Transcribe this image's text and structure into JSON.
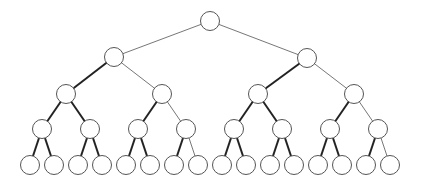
{
  "diagram": {
    "type": "binary-tree",
    "depth": 4,
    "node_radius": 9.5,
    "colors": {
      "node_stroke": "#555555",
      "thin_edge": "#777777",
      "thick_edge": "#222222",
      "background": "#ffffff"
    },
    "nodes": [
      {
        "id": 0,
        "x": 210,
        "y": 21
      },
      {
        "id": 1,
        "x": 114,
        "y": 57
      },
      {
        "id": 2,
        "x": 307,
        "y": 58
      },
      {
        "id": 3,
        "x": 66,
        "y": 94
      },
      {
        "id": 4,
        "x": 162,
        "y": 94
      },
      {
        "id": 5,
        "x": 258,
        "y": 94
      },
      {
        "id": 6,
        "x": 354,
        "y": 94
      },
      {
        "id": 7,
        "x": 42,
        "y": 129
      },
      {
        "id": 8,
        "x": 90,
        "y": 129
      },
      {
        "id": 9,
        "x": 138,
        "y": 129
      },
      {
        "id": 10,
        "x": 186,
        "y": 129
      },
      {
        "id": 11,
        "x": 234,
        "y": 129
      },
      {
        "id": 12,
        "x": 282,
        "y": 129
      },
      {
        "id": 13,
        "x": 330,
        "y": 129
      },
      {
        "id": 14,
        "x": 378,
        "y": 129
      },
      {
        "id": 15,
        "x": 30,
        "y": 165
      },
      {
        "id": 16,
        "x": 54,
        "y": 165
      },
      {
        "id": 17,
        "x": 78,
        "y": 165
      },
      {
        "id": 18,
        "x": 102,
        "y": 165
      },
      {
        "id": 19,
        "x": 126,
        "y": 165
      },
      {
        "id": 20,
        "x": 150,
        "y": 165
      },
      {
        "id": 21,
        "x": 174,
        "y": 165
      },
      {
        "id": 22,
        "x": 198,
        "y": 165
      },
      {
        "id": 23,
        "x": 222,
        "y": 165
      },
      {
        "id": 24,
        "x": 246,
        "y": 165
      },
      {
        "id": 25,
        "x": 270,
        "y": 165
      },
      {
        "id": 26,
        "x": 294,
        "y": 165
      },
      {
        "id": 27,
        "x": 318,
        "y": 165
      },
      {
        "id": 28,
        "x": 342,
        "y": 165
      },
      {
        "id": 29,
        "x": 366,
        "y": 165
      },
      {
        "id": 30,
        "x": 390,
        "y": 165
      }
    ],
    "edges": [
      {
        "from": 0,
        "to": 1,
        "style": "thin"
      },
      {
        "from": 0,
        "to": 2,
        "style": "thin"
      },
      {
        "from": 1,
        "to": 3,
        "style": "thick"
      },
      {
        "from": 1,
        "to": 4,
        "style": "thin"
      },
      {
        "from": 2,
        "to": 5,
        "style": "thick"
      },
      {
        "from": 2,
        "to": 6,
        "style": "thin"
      },
      {
        "from": 3,
        "to": 7,
        "style": "thick"
      },
      {
        "from": 3,
        "to": 8,
        "style": "thick"
      },
      {
        "from": 4,
        "to": 9,
        "style": "thick"
      },
      {
        "from": 4,
        "to": 10,
        "style": "thin"
      },
      {
        "from": 5,
        "to": 11,
        "style": "thick"
      },
      {
        "from": 5,
        "to": 12,
        "style": "thick"
      },
      {
        "from": 6,
        "to": 13,
        "style": "thick"
      },
      {
        "from": 6,
        "to": 14,
        "style": "thin"
      },
      {
        "from": 7,
        "to": 15,
        "style": "thick"
      },
      {
        "from": 7,
        "to": 16,
        "style": "thick"
      },
      {
        "from": 8,
        "to": 17,
        "style": "thick"
      },
      {
        "from": 8,
        "to": 18,
        "style": "thick"
      },
      {
        "from": 9,
        "to": 19,
        "style": "thick"
      },
      {
        "from": 9,
        "to": 20,
        "style": "thick"
      },
      {
        "from": 10,
        "to": 21,
        "style": "thick"
      },
      {
        "from": 10,
        "to": 22,
        "style": "thin"
      },
      {
        "from": 11,
        "to": 23,
        "style": "thick"
      },
      {
        "from": 11,
        "to": 24,
        "style": "thick"
      },
      {
        "from": 12,
        "to": 25,
        "style": "thick"
      },
      {
        "from": 12,
        "to": 26,
        "style": "thick"
      },
      {
        "from": 13,
        "to": 27,
        "style": "thick"
      },
      {
        "from": 13,
        "to": 28,
        "style": "thick"
      },
      {
        "from": 14,
        "to": 29,
        "style": "thick"
      },
      {
        "from": 14,
        "to": 30,
        "style": "thin"
      }
    ]
  }
}
